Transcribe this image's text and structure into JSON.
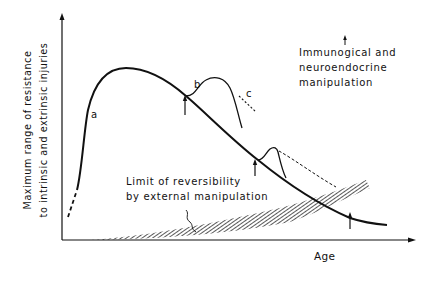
{
  "figure": {
    "type": "diagram",
    "y_axis_label_line1": "Maximum range of resistance",
    "y_axis_label_line2": "to intrinsic and extrinsic injuries",
    "x_axis_label": "Age",
    "curve_labels": {
      "a": "a",
      "b": "b",
      "c": "c"
    },
    "annotation_top_right": {
      "line1": "Immunogical and",
      "line2": "neuroendocrine",
      "line3": "manipulation"
    },
    "annotation_hatched": {
      "line1": "Limit of reversibility",
      "line2": "by external manipulation"
    },
    "colors": {
      "ink": "#111111",
      "background": "#ffffff"
    }
  }
}
